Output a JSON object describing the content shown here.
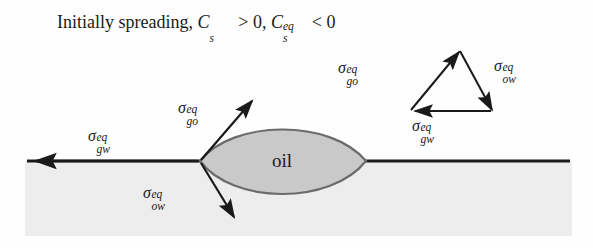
{
  "figure": {
    "title": {
      "text_plain": "Initially spreading, C_s > 0 , C_s^eq < 0",
      "prefix": "Initially spreading,",
      "var1": "C",
      "var1_sub": "s",
      "relation1": "> 0",
      "separator": ",",
      "var2": "C",
      "var2_sub": "s",
      "var2_sup": "eq",
      "relation2": "< 0"
    },
    "oil_label": "oil",
    "region_labels": {
      "oil": "oil"
    },
    "vectors": {
      "contact_point": [
        {
          "name": "sigma-gw-eq-left",
          "symbol": "σ",
          "sup": "eq",
          "sub": "gw",
          "direction": "left",
          "label_x": 88,
          "label_y": 128
        },
        {
          "name": "sigma-go-eq-left",
          "symbol": "σ",
          "sup": "eq",
          "sub": "go",
          "direction": "up-right",
          "label_x": 178,
          "label_y": 100
        },
        {
          "name": "sigma-ow-eq-left",
          "symbol": "σ",
          "sup": "eq",
          "sub": "ow",
          "direction": "down-right",
          "label_x": 143,
          "label_y": 185
        }
      ],
      "triangle": [
        {
          "name": "sigma-go-eq-triangle",
          "symbol": "σ",
          "sup": "eq",
          "sub": "go",
          "direction": "up-right",
          "label_x": 338,
          "label_y": 60
        },
        {
          "name": "sigma-ow-eq-triangle",
          "symbol": "σ",
          "sup": "eq",
          "sub": "ow",
          "direction": "down-right",
          "label_x": 494,
          "label_y": 58
        },
        {
          "name": "sigma-gw-eq-triangle",
          "symbol": "σ",
          "sup": "eq",
          "sub": "gw",
          "direction": "left",
          "label_x": 412,
          "label_y": 118
        }
      ]
    },
    "geometry": {
      "water_surface_y": 161,
      "water_left_x": 25,
      "water_right_x": 572,
      "water_bottom_y": 236,
      "lens_left_x": 200,
      "lens_right_x": 366,
      "lens_top_y": 124,
      "lens_bottom_y": 206,
      "triangle_apex": [
        458,
        50
      ],
      "triangle_left": [
        410,
        110
      ],
      "triangle_right": [
        492,
        110
      ]
    },
    "colors": {
      "background": "#fefefe",
      "water_fill": "#ededed",
      "oil_fill": "#c9c9c9",
      "oil_stroke": "#6b6b6b",
      "line": "#1a1a1a",
      "text": "#1a1a1a"
    }
  }
}
